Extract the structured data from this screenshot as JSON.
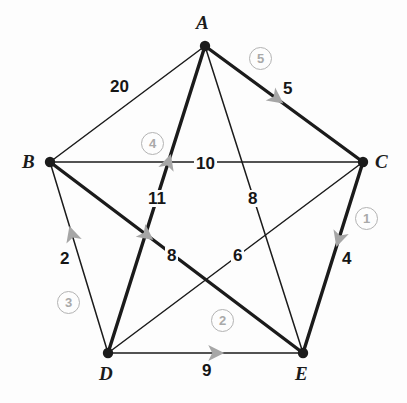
{
  "figure": {
    "name": "weighted-graph-minimum-spanning-tree",
    "type": "graph-diagram",
    "background_color": "#fdfdfd",
    "edge_color": "#1b1b1b",
    "highlight_arrow_color": "#a6a6a6",
    "badge_color": "#a9a9a9",
    "label_color": "#161616"
  },
  "vertices": [
    {
      "id": "A",
      "label": "A",
      "x": 205,
      "y": 46,
      "label_x": 196,
      "label_y": 13
    },
    {
      "id": "B",
      "label": "B",
      "x": 50,
      "y": 162,
      "label_x": 22,
      "label_y": 152
    },
    {
      "id": "C",
      "label": "C",
      "x": 363,
      "y": 162,
      "label_x": 375,
      "label_y": 152
    },
    {
      "id": "D",
      "label": "D",
      "x": 108,
      "y": 353,
      "label_x": 99,
      "label_y": 364
    },
    {
      "id": "E",
      "label": "E",
      "x": 303,
      "y": 353,
      "label_x": 295,
      "label_y": 364
    }
  ],
  "edges": [
    {
      "id": "AB",
      "from": "A",
      "to": "B",
      "weight": "20",
      "weight_x": 108,
      "weight_y": 78,
      "selected": false,
      "thick": false
    },
    {
      "id": "AC",
      "from": "A",
      "to": "C",
      "weight": "5",
      "weight_x": 281,
      "weight_y": 80,
      "selected": true,
      "thick": true,
      "arrow_t": 0.45,
      "arrow_dir": "A-to-C"
    },
    {
      "id": "AD",
      "from": "A",
      "to": "D",
      "weight": "11",
      "weight_x": 146,
      "weight_y": 190,
      "selected": true,
      "thick": true,
      "arrow_t": 0.62,
      "arrow_dir": "D-to-A"
    },
    {
      "id": "AE",
      "from": "A",
      "to": "E",
      "weight": "8",
      "weight_x": 246,
      "weight_y": 190,
      "selected": false,
      "thick": false
    },
    {
      "id": "BC",
      "from": "B",
      "to": "C",
      "weight": "10",
      "weight_x": 194,
      "weight_y": 155,
      "selected": false,
      "thick": false
    },
    {
      "id": "BD",
      "from": "B",
      "to": "D",
      "weight": "2",
      "weight_x": 58,
      "weight_y": 250,
      "selected": true,
      "thick": false,
      "arrow_t": 0.62,
      "arrow_dir": "D-to-B"
    },
    {
      "id": "BE",
      "from": "B",
      "to": "E",
      "weight": "8",
      "weight_x": 165,
      "weight_y": 247,
      "selected": true,
      "thick": true,
      "arrow_t": 0.38,
      "arrow_dir": "B-to-E"
    },
    {
      "id": "CD",
      "from": "C",
      "to": "D",
      "weight": "6",
      "weight_x": 231,
      "weight_y": 247,
      "selected": false,
      "thick": false
    },
    {
      "id": "CE",
      "from": "C",
      "to": "E",
      "weight": "4",
      "weight_x": 340,
      "weight_y": 250,
      "selected": true,
      "thick": true,
      "arrow_t": 0.4,
      "arrow_dir": "C-to-E"
    },
    {
      "id": "DE",
      "from": "D",
      "to": "E",
      "weight": "9",
      "weight_x": 200,
      "weight_y": 362,
      "selected": true,
      "thick": false,
      "arrow_t": 0.55,
      "arrow_dir": "D-to-E"
    }
  ],
  "step_badges": [
    {
      "id": "step-1",
      "label": "①",
      "text": "1",
      "edge": "CE",
      "x": 355,
      "y": 207
    },
    {
      "id": "step-2",
      "label": "②",
      "text": "2",
      "edge": "DE",
      "x": 211,
      "y": 309
    },
    {
      "id": "step-3",
      "label": "③",
      "text": "3",
      "edge": "BD",
      "x": 57,
      "y": 291
    },
    {
      "id": "step-4",
      "label": "④",
      "text": "4",
      "edge": "AD",
      "x": 141,
      "y": 132
    },
    {
      "id": "step-5",
      "label": "⑤",
      "text": "5",
      "edge": "AC",
      "x": 249,
      "y": 47
    }
  ],
  "chart_data": {
    "type": "graph",
    "title": "",
    "node_count": 5,
    "edge_count": 10,
    "nodes": [
      "A",
      "B",
      "C",
      "D",
      "E"
    ],
    "weighted_edges": [
      {
        "pair": "A-B",
        "weight": 20
      },
      {
        "pair": "A-C",
        "weight": 5
      },
      {
        "pair": "A-D",
        "weight": 11
      },
      {
        "pair": "A-E",
        "weight": 8
      },
      {
        "pair": "B-C",
        "weight": 10
      },
      {
        "pair": "B-D",
        "weight": 2
      },
      {
        "pair": "B-E",
        "weight": 8
      },
      {
        "pair": "C-D",
        "weight": 6
      },
      {
        "pair": "C-E",
        "weight": 4
      },
      {
        "pair": "D-E",
        "weight": 9
      }
    ],
    "selection_order": [
      {
        "step": 1,
        "pair": "C-E",
        "weight": 4
      },
      {
        "step": 2,
        "pair": "D-E",
        "weight": 9
      },
      {
        "step": 3,
        "pair": "B-D",
        "weight": 2
      },
      {
        "step": 4,
        "pair": "A-D",
        "weight": 11
      },
      {
        "step": 5,
        "pair": "A-C",
        "weight": 5
      }
    ]
  }
}
